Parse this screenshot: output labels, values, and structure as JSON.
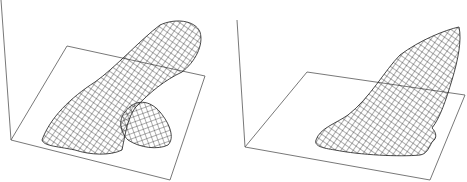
{
  "figure": {
    "panels": [
      {
        "id": "left",
        "description": "3D wireframe surface: elongated tube with a side lobe over a base plane",
        "axis_line": [
          [
            1,
            0
          ],
          [
            11,
            140
          ]
        ],
        "plane": [
          [
            11,
            140
          ],
          [
            67,
            46
          ],
          [
            205,
            76
          ],
          [
            170,
            180
          ]
        ]
      },
      {
        "id": "right",
        "description": "3D wireframe surface: tapered fin-like shape rising over a base plane",
        "axis_line": [
          [
            237,
            20
          ],
          [
            245,
            147
          ]
        ],
        "plane": [
          [
            245,
            147
          ],
          [
            307,
            72
          ],
          [
            465,
            95
          ],
          [
            430,
            180
          ]
        ]
      }
    ],
    "colors": {
      "line": "#1a1a1a",
      "axis": "#555555",
      "background": "#ffffff"
    }
  }
}
